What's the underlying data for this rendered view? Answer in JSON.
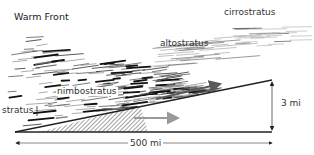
{
  "diagram": {
    "title": "Warm Front",
    "clouds": [
      {
        "name": "cirrostratus",
        "label": "cirrostratus"
      },
      {
        "name": "altostratus",
        "label": "altostratus"
      },
      {
        "name": "nimbostratus",
        "label": "nimbostratus"
      },
      {
        "name": "stratus",
        "label": "stratus"
      }
    ],
    "dimensions": {
      "horizontal_extent": "500 mi",
      "vertical_extent": "3 mi"
    },
    "arrows": [
      {
        "name": "warm-air-flow",
        "direction": "up-slope",
        "color": "#5a5a5a"
      },
      {
        "name": "cold-air-flow",
        "direction": "horizontal",
        "color": "#9a9a9a"
      }
    ],
    "colors": {
      "line": "#222222",
      "cloud": "#111111",
      "hatch": "#444444"
    }
  }
}
